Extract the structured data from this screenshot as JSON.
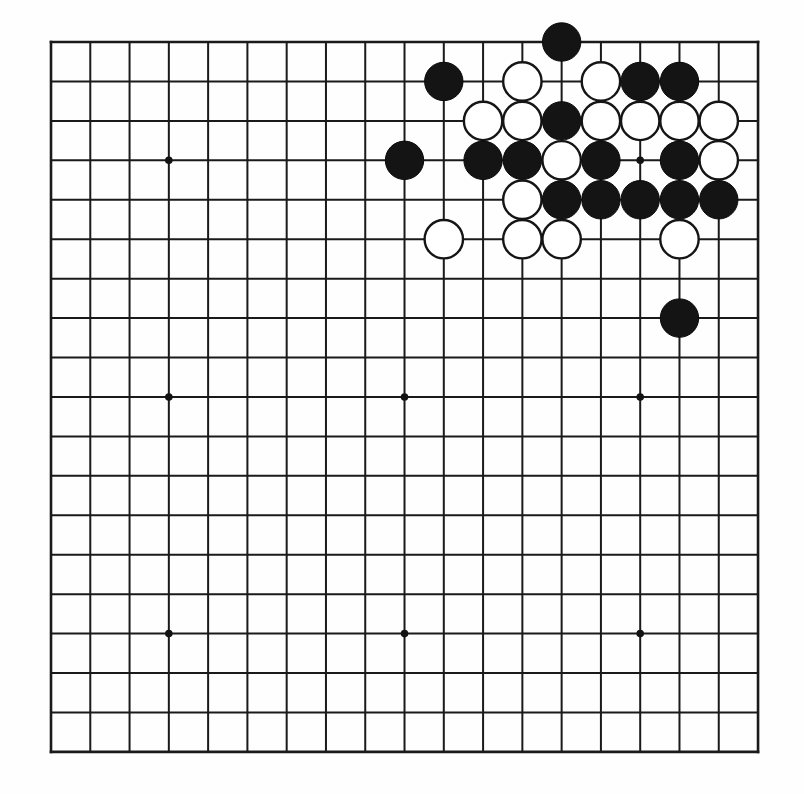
{
  "diagram": {
    "title": "Go board position",
    "board_size": 19,
    "background_color": "#fefefe",
    "line_color": "#1a1a1a",
    "black_stone_color": "#141414",
    "white_stone_color": "#ffffff",
    "geometry": {
      "origin_x": 51,
      "origin_y": 42,
      "spacing_x": 39.28,
      "spacing_y": 39.44,
      "stone_radius": 19.2,
      "star_radius": 3.8
    },
    "star_points": [
      {
        "col": 4,
        "row": 4
      },
      {
        "col": 10,
        "row": 4
      },
      {
        "col": 16,
        "row": 4
      },
      {
        "col": 4,
        "row": 10
      },
      {
        "col": 10,
        "row": 10
      },
      {
        "col": 16,
        "row": 10
      },
      {
        "col": 4,
        "row": 16
      },
      {
        "col": 10,
        "row": 16
      },
      {
        "col": 16,
        "row": 16
      }
    ],
    "stones": [
      {
        "color": "black",
        "col": 14,
        "row": 1
      },
      {
        "color": "black",
        "col": 11,
        "row": 2
      },
      {
        "color": "white",
        "col": 13,
        "row": 2
      },
      {
        "color": "white",
        "col": 15,
        "row": 2
      },
      {
        "color": "black",
        "col": 16,
        "row": 2
      },
      {
        "color": "black",
        "col": 17,
        "row": 2
      },
      {
        "color": "white",
        "col": 12,
        "row": 3
      },
      {
        "color": "white",
        "col": 13,
        "row": 3
      },
      {
        "color": "black",
        "col": 14,
        "row": 3
      },
      {
        "color": "white",
        "col": 15,
        "row": 3
      },
      {
        "color": "white",
        "col": 16,
        "row": 3
      },
      {
        "color": "white",
        "col": 17,
        "row": 3
      },
      {
        "color": "white",
        "col": 18,
        "row": 3
      },
      {
        "color": "black",
        "col": 10,
        "row": 4
      },
      {
        "color": "black",
        "col": 12,
        "row": 4
      },
      {
        "color": "black",
        "col": 13,
        "row": 4
      },
      {
        "color": "white",
        "col": 14,
        "row": 4
      },
      {
        "color": "black",
        "col": 15,
        "row": 4
      },
      {
        "color": "black",
        "col": 17,
        "row": 4
      },
      {
        "color": "white",
        "col": 18,
        "row": 4
      },
      {
        "color": "white",
        "col": 13,
        "row": 5
      },
      {
        "color": "black",
        "col": 14,
        "row": 5
      },
      {
        "color": "black",
        "col": 15,
        "row": 5
      },
      {
        "color": "black",
        "col": 16,
        "row": 5
      },
      {
        "color": "black",
        "col": 17,
        "row": 5
      },
      {
        "color": "black",
        "col": 18,
        "row": 5
      },
      {
        "color": "white",
        "col": 11,
        "row": 6
      },
      {
        "color": "white",
        "col": 13,
        "row": 6
      },
      {
        "color": "white",
        "col": 14,
        "row": 6
      },
      {
        "color": "white",
        "col": 17,
        "row": 6
      },
      {
        "color": "black",
        "col": 17,
        "row": 8
      }
    ],
    "counts": {
      "black_stones": 16,
      "white_stones": 15,
      "total_stones": 31
    }
  }
}
